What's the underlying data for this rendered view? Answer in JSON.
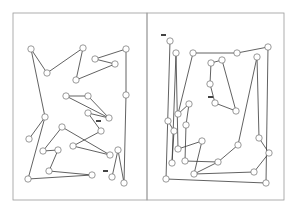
{
  "panels": [
    {
      "id": "left",
      "frame": {
        "x": 13,
        "y": 13,
        "w": 134,
        "h": 187
      },
      "nodes": [
        [
          31,
          49
        ],
        [
          47,
          73
        ],
        [
          83,
          48
        ],
        [
          76,
          80
        ],
        [
          95,
          59
        ],
        [
          115,
          64
        ],
        [
          126,
          49
        ],
        [
          126,
          95
        ],
        [
          66,
          96
        ],
        [
          88,
          96
        ],
        [
          109,
          118
        ],
        [
          88,
          113
        ],
        [
          45,
          117
        ],
        [
          29,
          139
        ],
        [
          62,
          127
        ],
        [
          101,
          131
        ],
        [
          73,
          146
        ],
        [
          110,
          155
        ],
        [
          43,
          151
        ],
        [
          58,
          150
        ],
        [
          49,
          171
        ],
        [
          92,
          175
        ],
        [
          28,
          179
        ],
        [
          118,
          150
        ],
        [
          124,
          183
        ],
        [
          112,
          177
        ]
      ],
      "edges": [
        [
          22,
          12
        ],
        [
          12,
          0
        ],
        [
          0,
          1
        ],
        [
          1,
          2
        ],
        [
          2,
          3
        ],
        [
          3,
          5
        ],
        [
          5,
          4
        ],
        [
          4,
          6
        ],
        [
          6,
          7
        ],
        [
          7,
          24
        ],
        [
          24,
          23
        ],
        [
          23,
          25
        ],
        [
          8,
          9
        ],
        [
          9,
          10
        ],
        [
          10,
          11
        ],
        [
          11,
          15
        ],
        [
          15,
          16
        ],
        [
          16,
          17
        ],
        [
          17,
          14
        ],
        [
          14,
          18
        ],
        [
          18,
          19
        ],
        [
          19,
          20
        ],
        [
          20,
          21
        ],
        [
          21,
          22
        ],
        [
          13,
          12
        ],
        [
          8,
          10
        ]
      ],
      "marks": [
        [
          96,
          121
        ],
        [
          103,
          171
        ]
      ]
    },
    {
      "id": "right",
      "frame": {
        "x": 147,
        "y": 13,
        "w": 137,
        "h": 187
      },
      "nodes": [
        [
          170,
          41
        ],
        [
          176,
          53
        ],
        [
          193,
          53
        ],
        [
          237,
          53
        ],
        [
          268,
          47
        ],
        [
          222,
          60
        ],
        [
          257,
          57
        ],
        [
          211,
          63
        ],
        [
          210,
          84
        ],
        [
          215,
          103
        ],
        [
          236,
          111
        ],
        [
          178,
          114
        ],
        [
          189,
          104
        ],
        [
          238,
          145
        ],
        [
          186,
          125
        ],
        [
          168,
          121
        ],
        [
          172,
          163
        ],
        [
          185,
          161
        ],
        [
          218,
          162
        ],
        [
          194,
          174
        ],
        [
          254,
          172
        ],
        [
          269,
          153
        ],
        [
          259,
          138
        ],
        [
          174,
          131
        ],
        [
          178,
          149
        ],
        [
          166,
          179
        ],
        [
          266,
          183
        ],
        [
          202,
          141
        ]
      ],
      "edges": [
        [
          0,
          25
        ],
        [
          1,
          16
        ],
        [
          1,
          24
        ],
        [
          2,
          3
        ],
        [
          3,
          4
        ],
        [
          4,
          26
        ],
        [
          2,
          11
        ],
        [
          5,
          7
        ],
        [
          7,
          8
        ],
        [
          8,
          9
        ],
        [
          9,
          10
        ],
        [
          5,
          10
        ],
        [
          6,
          22
        ],
        [
          6,
          13
        ],
        [
          13,
          18
        ],
        [
          18,
          19
        ],
        [
          19,
          20
        ],
        [
          20,
          21
        ],
        [
          21,
          22
        ],
        [
          11,
          12
        ],
        [
          12,
          14
        ],
        [
          14,
          17
        ],
        [
          17,
          18
        ],
        [
          15,
          23
        ],
        [
          23,
          16
        ],
        [
          25,
          26
        ],
        [
          24,
          27
        ],
        [
          27,
          19
        ]
      ],
      "marks": [
        [
          161,
          35
        ],
        [
          208,
          97
        ]
      ]
    }
  ]
}
